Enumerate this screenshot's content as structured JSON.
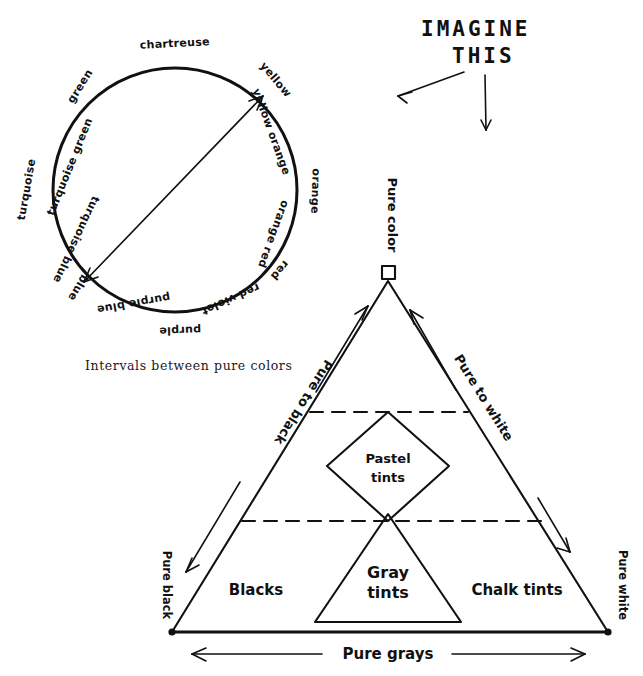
{
  "page": {
    "ink_color": "#111111",
    "background_color": "#ffffff"
  },
  "headline": {
    "line1": "IMAGINE",
    "line2": "THIS",
    "arrow_left_name": "arrow-to-color-wheel",
    "arrow_down_name": "arrow-to-color-triangle"
  },
  "color_wheel": {
    "caption": "Intervals between pure colors",
    "center_arrow_note": "double-headed diameter arrow from purple-blue to yellow",
    "labels": [
      {
        "text": "chartreuse",
        "angle_deg": -80
      },
      {
        "text": "green",
        "angle_deg": -130
      },
      {
        "text": "turquoise green",
        "angle_deg": -155
      },
      {
        "text": "turquoise",
        "angle_deg": 180
      },
      {
        "text": "turquoise blue",
        "angle_deg": 155
      },
      {
        "text": "blue",
        "angle_deg": 130
      },
      {
        "text": "purple blue",
        "angle_deg": 108
      },
      {
        "text": "purple",
        "angle_deg": 85
      },
      {
        "text": "red violet",
        "angle_deg": 60
      },
      {
        "text": "red",
        "angle_deg": 38
      },
      {
        "text": "orange red",
        "angle_deg": 22
      },
      {
        "text": "orange",
        "angle_deg": 2
      },
      {
        "text": "yellow orange",
        "angle_deg": -28
      },
      {
        "text": "yellow",
        "angle_deg": -50
      }
    ]
  },
  "color_triangle": {
    "apex_label": "Pure color",
    "left_corner_label": "Pure black",
    "right_corner_label": "Pure white",
    "left_edge_label": "Pure to black",
    "right_edge_label": "Pure to white",
    "base_label": "Pure grays",
    "zones": [
      {
        "name": "pastel-tints",
        "label_line1": "Pastel",
        "label_line2": "tints"
      },
      {
        "name": "gray-tints",
        "label_line1": "Gray",
        "label_line2": "tints"
      },
      {
        "name": "blacks",
        "label_line1": "Blacks",
        "label_line2": ""
      },
      {
        "name": "chalk-tints",
        "label_line1": "Chalk tints",
        "label_line2": ""
      }
    ]
  }
}
